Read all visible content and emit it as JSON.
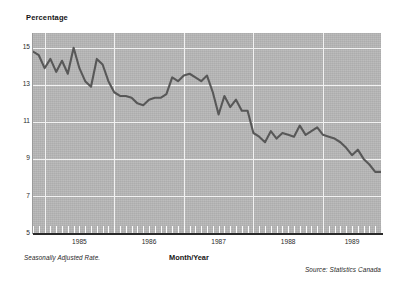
{
  "chart_data": {
    "type": "line",
    "title": "",
    "ylabel": "Percentage",
    "xlabel": "Month/Year",
    "ylim": [
      5,
      15.8
    ],
    "yticks": [
      15,
      13,
      11,
      9,
      7,
      5
    ],
    "ytick_labels": [
      "15",
      "13",
      "11",
      "9",
      "7",
      "5"
    ],
    "xtick_labels": [
      "1985",
      "1986",
      "1987",
      "1988",
      "1989"
    ],
    "xlim": [
      "1984-11",
      "1989-11"
    ],
    "grid": true,
    "legend": "none",
    "series_name": "Unemployment Rate",
    "x": [
      "1984-11",
      "1984-12",
      "1985-01",
      "1985-02",
      "1985-03",
      "1985-04",
      "1985-05",
      "1985-06",
      "1985-07",
      "1985-08",
      "1985-09",
      "1985-10",
      "1985-11",
      "1985-12",
      "1986-01",
      "1986-02",
      "1986-03",
      "1986-04",
      "1986-05",
      "1986-06",
      "1986-07",
      "1986-08",
      "1986-09",
      "1986-10",
      "1986-11",
      "1986-12",
      "1987-01",
      "1987-02",
      "1987-03",
      "1987-04",
      "1987-05",
      "1987-06",
      "1987-07",
      "1987-08",
      "1987-09",
      "1987-10",
      "1987-11",
      "1987-12",
      "1988-01",
      "1988-02",
      "1988-03",
      "1988-04",
      "1988-05",
      "1988-06",
      "1988-07",
      "1988-08",
      "1988-09",
      "1988-10",
      "1988-11",
      "1988-12",
      "1989-01",
      "1989-02",
      "1989-03",
      "1989-04",
      "1989-05",
      "1989-06",
      "1989-07",
      "1989-08",
      "1989-09",
      "1989-10",
      "1989-11"
    ],
    "values": [
      14.8,
      14.6,
      13.9,
      14.4,
      13.7,
      14.3,
      13.6,
      15.0,
      13.9,
      13.2,
      12.9,
      14.4,
      14.1,
      13.2,
      12.6,
      12.4,
      12.4,
      12.3,
      12.0,
      11.9,
      12.2,
      12.3,
      12.3,
      12.5,
      13.4,
      13.2,
      13.5,
      13.6,
      13.4,
      13.2,
      13.5,
      12.6,
      11.4,
      12.4,
      11.8,
      12.2,
      11.6,
      11.6,
      10.4,
      10.2,
      9.9,
      10.5,
      10.1,
      10.4,
      10.3,
      10.2,
      10.8,
      10.3,
      10.5,
      10.7,
      10.3,
      10.2,
      10.1,
      9.9,
      9.6,
      9.2,
      9.5,
      9.0,
      8.7,
      8.3,
      8.3
    ],
    "line_color": "#585858",
    "plot_background": "#b6b6b6",
    "grid_color": "#f2f2f2"
  },
  "notes": {
    "left": "Seasonally Adjusted Rate.",
    "source": "Source: Statistics Canada"
  }
}
